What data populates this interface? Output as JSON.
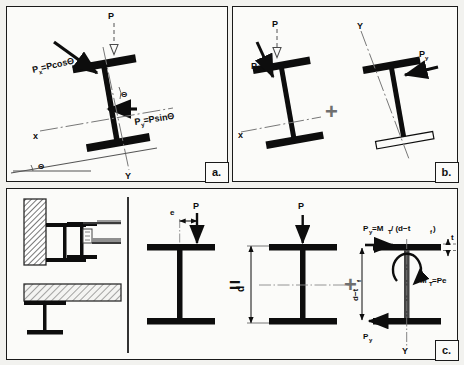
{
  "figure": {
    "background_color": "#f2f2ef",
    "panel_fill": "#fbfbf9",
    "ink_color": "#0d0d0d",
    "accent_gray": "#6f6f6f"
  },
  "panels": [
    {
      "id": "a",
      "tag": "a.",
      "caption": "Inclined I-section with vertical load P resolved into Px and Py components",
      "labels": {
        "load": "P",
        "px": "P",
        "px_sub": "x",
        "px_expr": "=PcosΘ",
        "py": "P",
        "py_sub": "y",
        "py_expr": "=PsinΘ",
        "axis_x": "x",
        "axis_y": "Y",
        "angle": "Θ",
        "angle_ground": "Θ"
      }
    },
    {
      "id": "b",
      "tag": "b.",
      "caption": "Decomposition into bending about x axis plus bending about y axis",
      "labels": {
        "load": "P",
        "px": "P",
        "px_sub": "x",
        "axis_x": "x",
        "py": "P",
        "py_sub": "y",
        "axis_y": "Y",
        "operator": "+"
      }
    },
    {
      "id": "c",
      "tag": "c.",
      "caption": "Eccentric load P at eccentricity e equals axial bending plus flange force couple from torsion",
      "labels": {
        "eccentricity": "e",
        "load": "P",
        "operator_equals": "=",
        "operator_plus": "+",
        "depth": "d",
        "flange_force_expr_1": "P",
        "flange_force_sub_1": "y",
        "flange_force_expr_2": "=M",
        "flange_force_sub_2": "T",
        "flange_force_expr_3": "/ (d−t",
        "flange_force_sub_3": "f",
        "flange_force_expr_4": ")",
        "flange_thickness": "t",
        "flange_thickness_sub": "f",
        "lever_arm": "d−t",
        "lever_arm_sub": "f",
        "torsion_moment": "M",
        "torsion_moment_sub": "T",
        "torsion_moment_expr": "=Pe",
        "bottom_force": "P",
        "bottom_force_sub": "y",
        "axis_y": "Y"
      },
      "detail_drawings": [
        {
          "name": "beam-against-wall",
          "hatch": "crosshatch-dark"
        },
        {
          "name": "beam-with-connection-detail",
          "hatch": "none"
        },
        {
          "name": "beam-supporting-slab",
          "hatch": "crosshatch-light"
        }
      ]
    }
  ]
}
